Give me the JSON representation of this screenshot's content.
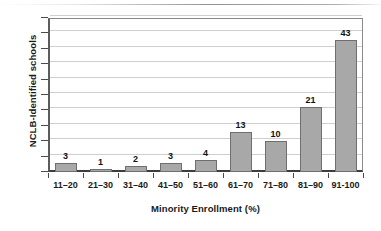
{
  "chart_data": {
    "type": "bar",
    "title": "",
    "subtitle": "",
    "xlabel": "Minority Enrollment (%)",
    "ylabel": "NCLB-Identified schools",
    "categories": [
      "11–20",
      "21–30",
      "31–40",
      "41–50",
      "51–60",
      "61–70",
      "71–80",
      "81–90",
      "91-100"
    ],
    "values": [
      3,
      1,
      2,
      3,
      4,
      13,
      10,
      21,
      43
    ],
    "value_labels": [
      "3",
      "1",
      "2",
      "3",
      "4",
      "13",
      "10",
      "21",
      "43"
    ],
    "ylim": [
      0,
      50
    ],
    "y_tick_step": 5,
    "y_tick_labels": [],
    "y_gridline_values": [
      5,
      10,
      15,
      20,
      25,
      30,
      35,
      40,
      45,
      50
    ],
    "grid": true,
    "legend": false,
    "legend_position": "none",
    "bar_color": "#a8a8a8",
    "bar_border_color": "#6f6f6f",
    "gridline_color": "#cfcfcf",
    "axis_color": "#4a4a4a",
    "text_color": "#1a1a1a"
  }
}
